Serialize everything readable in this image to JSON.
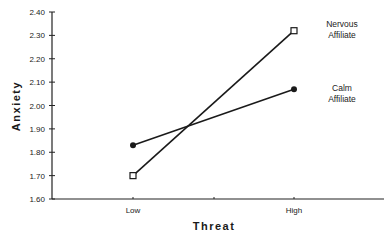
{
  "chart_data": {
    "type": "line",
    "title": "",
    "xlabel": "Threat",
    "ylabel": "Anxiety",
    "categories": [
      "Low",
      "High"
    ],
    "ylim": [
      1.6,
      2.4
    ],
    "yticks": [
      "1.60",
      "1.70",
      "1.80",
      "1.90",
      "2.00",
      "2.10",
      "2.20",
      "2.30",
      "2.40"
    ],
    "grid": false,
    "legend_position": "right, inline labels at line ends",
    "series": [
      {
        "name": "Nervous Affiliate",
        "label_line1": "Nervous",
        "label_line2": "Affiliate",
        "marker": "open-square",
        "values": [
          1.7,
          2.32
        ]
      },
      {
        "name": "Calm Affiliate",
        "label_line1": "Calm",
        "label_line2": "Affiliate",
        "marker": "filled-circle",
        "values": [
          1.83,
          2.07
        ]
      }
    ]
  }
}
